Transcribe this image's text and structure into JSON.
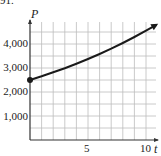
{
  "figure_number": "91.",
  "chart_data": {
    "type": "line",
    "title": "",
    "xlabel": "t",
    "ylabel": "P",
    "xlim": [
      0,
      11
    ],
    "ylim": [
      0,
      5000
    ],
    "x_ticks": [
      5,
      10
    ],
    "x_tick_labels": [
      "5",
      "10"
    ],
    "y_ticks": [
      1000,
      2000,
      3000,
      4000
    ],
    "y_tick_labels": [
      "1,000",
      "2,000",
      "3,000",
      "4,000"
    ],
    "grid": true,
    "grid_x_step": 1,
    "grid_y_step": 500,
    "legend": null,
    "series": [
      {
        "name": "P(t)",
        "x": [
          0,
          1,
          2,
          3,
          4,
          5,
          6,
          7,
          8,
          9,
          10,
          10.9
        ],
        "values": [
          2500,
          2655,
          2819,
          2993,
          3178,
          3375,
          3583,
          3805,
          4040,
          4290,
          4555,
          4800
        ],
        "start_marker": "filled-circle",
        "end_marker": "arrow"
      }
    ]
  }
}
